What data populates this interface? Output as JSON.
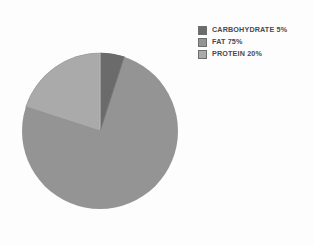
{
  "chart_data": {
    "type": "pie",
    "title": "",
    "subtitle": "",
    "xlabel": "",
    "ylabel": "",
    "grid": false,
    "legend_position": "top-right",
    "start_angle_deg": 0,
    "direction": "clockwise",
    "categories": [
      "CARBOHYDRATE",
      "FAT",
      "PROTEIN"
    ],
    "values": [
      5,
      75,
      20
    ],
    "value_unit": "%",
    "slices": [
      {
        "label": "CARBOHYDRATE",
        "value": 5,
        "display": "CARBOHYDRATE 5%",
        "color": "#6b6b6b",
        "start_deg": 0,
        "end_deg": 18
      },
      {
        "label": "FAT",
        "value": 75,
        "display": "FAT 75%",
        "color": "#949494",
        "start_deg": 18,
        "end_deg": 288
      },
      {
        "label": "PROTEIN",
        "value": 20,
        "display": "PROTEIN 20%",
        "color": "#aaaaaa",
        "start_deg": 288,
        "end_deg": 360
      }
    ]
  },
  "legend": {
    "entries": [
      {
        "swatch_color": "#6b6b6b",
        "label": "CARBOHYDRATE 5%"
      },
      {
        "swatch_color": "#949494",
        "label": "FAT 75%"
      },
      {
        "swatch_color": "#aaaaaa",
        "label": "PROTEIN 20%"
      }
    ]
  },
  "colors": {
    "background": "#fdfdfd",
    "carbohydrate": "#6b6b6b",
    "fat": "#949494",
    "protein": "#aaaaaa",
    "slice_border": "#7d7d7d",
    "legend_text": "#4a4a4a",
    "legend_swatch_border": "#6e6e6e"
  }
}
